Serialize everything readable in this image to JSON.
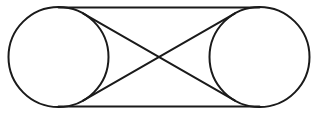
{
  "diagram": {
    "type": "belt-pulley-crossed-tangents",
    "width": 318,
    "height": 114,
    "background": "#ffffff",
    "stroke_color": "#1a1a1a",
    "stroke_width": 2,
    "circles": [
      {
        "name": "left-circle",
        "cx": 58.5,
        "cy": 57,
        "r": 50
      },
      {
        "name": "right-circle",
        "cx": 259.5,
        "cy": 57,
        "r": 50
      }
    ],
    "lines": [
      {
        "name": "top-tangent-line",
        "x1": 58.5,
        "y1": 7.5,
        "x2": 259.5,
        "y2": 7.5
      },
      {
        "name": "bottom-tangent-line",
        "x1": 58.5,
        "y1": 106.5,
        "x2": 259.5,
        "y2": 106.5
      },
      {
        "name": "cross-line-descending",
        "x1": 83,
        "y1": 13.4,
        "x2": 235,
        "y2": 100.6
      },
      {
        "name": "cross-line-ascending",
        "x1": 83,
        "y1": 100.6,
        "x2": 235,
        "y2": 13.4
      }
    ],
    "crossing_point": {
      "x": 159,
      "y": 57
    }
  }
}
